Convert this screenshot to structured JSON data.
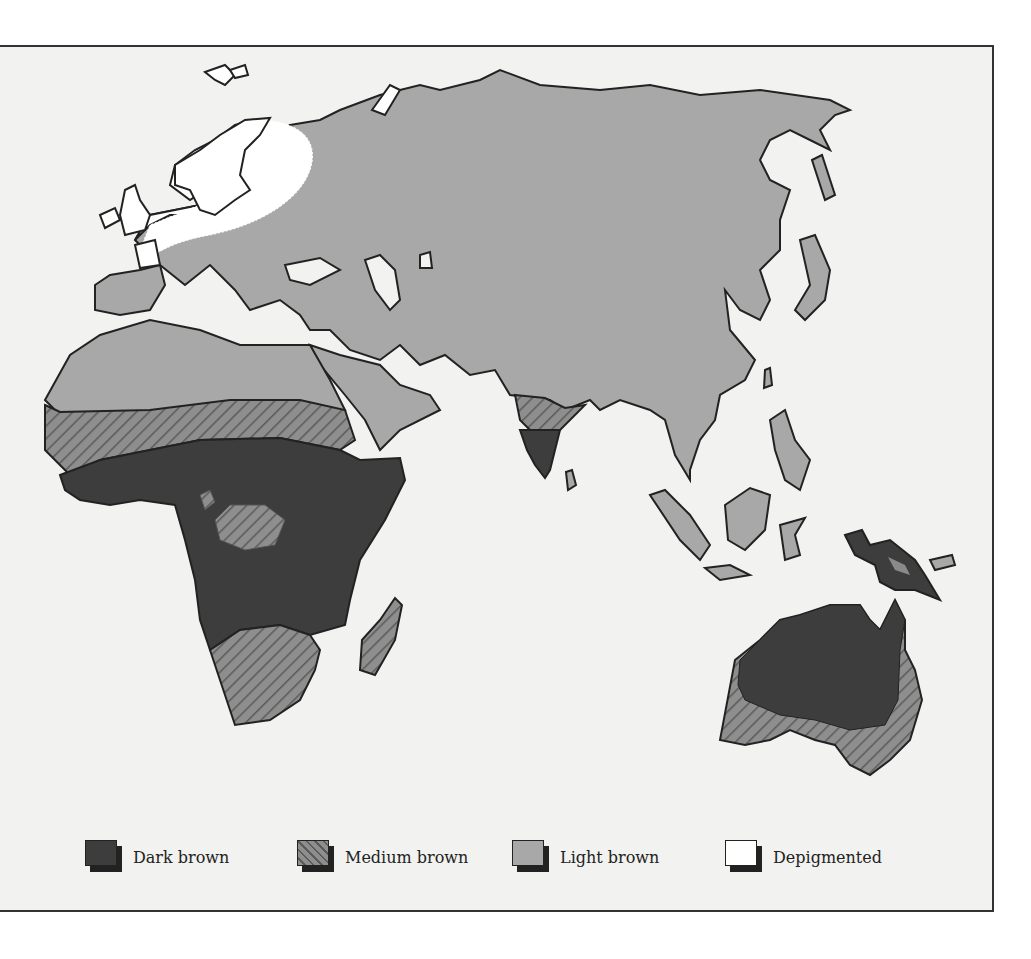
{
  "map": {
    "subject": "Distribution of skin pigmentation in Eastern Hemisphere populations",
    "regions": [
      {
        "name": "Sub-Saharan central Africa",
        "category": "Dark brown"
      },
      {
        "name": "Sahel band",
        "category": "Medium brown"
      },
      {
        "name": "Southern Africa",
        "category": "Medium brown"
      },
      {
        "name": "Central African islands",
        "category": "Medium brown"
      },
      {
        "name": "Madagascar",
        "category": "Medium brown"
      },
      {
        "name": "Northern Africa",
        "category": "Light brown"
      },
      {
        "name": "Southern India",
        "category": "Dark brown"
      },
      {
        "name": "Northern India",
        "category": "Medium brown"
      },
      {
        "name": "Eurasia",
        "category": "Light brown"
      },
      {
        "name": "Northern Europe",
        "category": "Depigmented"
      },
      {
        "name": "New Guinea",
        "category": "Dark brown"
      },
      {
        "name": "Northern and central Australia",
        "category": "Dark brown"
      },
      {
        "name": "Southern and eastern Australia",
        "category": "Medium brown"
      },
      {
        "name": "Southeast Asia",
        "category": "Light brown"
      }
    ]
  },
  "legend": {
    "items": [
      {
        "key": "dark",
        "label": "Dark brown",
        "color": "#3d3d3d",
        "pattern": "solid"
      },
      {
        "key": "medium",
        "label": "Medium brown",
        "color": "#8a8a8a",
        "pattern": "diagonal-hatch"
      },
      {
        "key": "light",
        "label": "Light brown",
        "color": "#a8a8a8",
        "pattern": "solid"
      },
      {
        "key": "depigmented",
        "label": "Depigmented",
        "color": "#ffffff",
        "pattern": "solid"
      }
    ]
  },
  "colors": {
    "background": "#f2f2f0",
    "dark_brown": "#3d3d3d",
    "medium_brown": "#8a8a8a",
    "medium_hatch": "#555555",
    "light_brown": "#a8a8a8",
    "depigmented": "#ffffff",
    "outline": "#222222"
  }
}
